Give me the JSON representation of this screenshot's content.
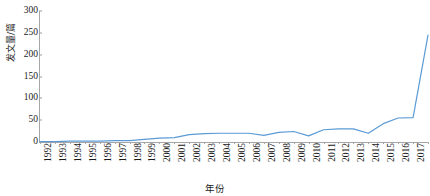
{
  "chart_data": {
    "type": "line",
    "title": "",
    "xlabel": "年份",
    "ylabel": "发文量/篇",
    "xlim": [
      1992,
      2018
    ],
    "ylim": [
      0,
      300
    ],
    "ytick_step": 50,
    "grid": false,
    "legend": false,
    "line_color": "#5B9BD5",
    "line_width": 1.2,
    "markers": false,
    "categories": [
      "1992",
      "1993",
      "1994",
      "1995",
      "1996",
      "1997",
      "1998",
      "1999",
      "2000",
      "2001",
      "2002",
      "2003",
      "2004",
      "2005",
      "2006",
      "2007",
      "2008",
      "2009",
      "2010",
      "2011",
      "2012",
      "2013",
      "2014",
      "2015",
      "2016",
      "2017",
      "2018"
    ],
    "values": [
      1,
      1,
      2,
      2,
      2,
      3,
      3,
      6,
      9,
      10,
      17,
      19,
      20,
      20,
      20,
      15,
      22,
      24,
      14,
      28,
      30,
      30,
      20,
      42,
      55,
      56,
      245
    ],
    "yticks": [
      "0",
      "50",
      "100",
      "150",
      "200",
      "250",
      "300"
    ],
    "ytick_values": [
      0,
      50,
      100,
      150,
      200,
      250,
      300
    ]
  }
}
